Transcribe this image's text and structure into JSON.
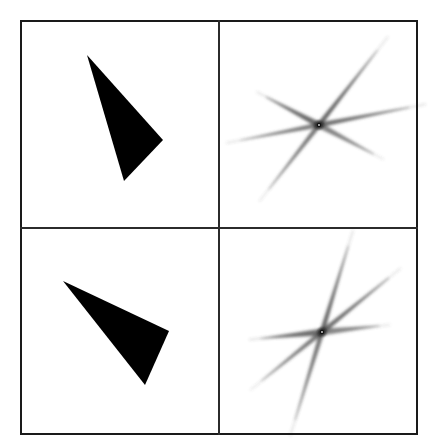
{
  "figure": {
    "type": "image-grid",
    "background_color": "#ffffff",
    "canvas": {
      "width": 437,
      "height": 448
    },
    "frame": {
      "x": 20,
      "y": 20,
      "width": 398,
      "height": 415,
      "border_color": "#1a1a1a",
      "border_width": 2,
      "divider_color": "#2b2b2b",
      "divider_width": 2,
      "divider_x": 219,
      "divider_y": 228
    },
    "panels": [
      {
        "name": "top-left-triangle",
        "row": 0,
        "col": 0,
        "content": "triangle",
        "fill_color": "#000000",
        "vertices": [
          [
            87,
            55
          ],
          [
            163,
            140
          ],
          [
            124,
            181
          ]
        ]
      },
      {
        "name": "top-right-spectrum",
        "row": 0,
        "col": 1,
        "content": "spectrum-star",
        "center": [
          319,
          125
        ],
        "core_color": "#111111",
        "ray_color": "#4a4a4a",
        "rays": [
          {
            "angle_deg": -52,
            "length": 95,
            "width": 5,
            "opacity": 0.82
          },
          {
            "angle_deg": 128,
            "length": 82,
            "width": 5,
            "opacity": 0.72
          },
          {
            "angle_deg": -11,
            "length": 92,
            "width": 5,
            "opacity": 0.78
          },
          {
            "angle_deg": 169,
            "length": 80,
            "width": 5,
            "opacity": 0.7
          },
          {
            "angle_deg": -152,
            "length": 60,
            "width": 6,
            "opacity": 0.8
          },
          {
            "angle_deg": 28,
            "length": 62,
            "width": 6,
            "opacity": 0.66
          }
        ]
      },
      {
        "name": "bottom-left-triangle",
        "row": 1,
        "col": 0,
        "content": "triangle",
        "fill_color": "#000000",
        "vertices": [
          [
            63,
            281
          ],
          [
            169,
            331
          ],
          [
            145,
            385
          ]
        ]
      },
      {
        "name": "bottom-right-spectrum",
        "row": 1,
        "col": 1,
        "content": "spectrum-star",
        "center": [
          322,
          332
        ],
        "core_color": "#111111",
        "ray_color": "#4a4a4a",
        "rays": [
          {
            "angle_deg": -73,
            "length": 90,
            "width": 5,
            "opacity": 0.8
          },
          {
            "angle_deg": 107,
            "length": 92,
            "width": 5,
            "opacity": 0.74
          },
          {
            "angle_deg": -39,
            "length": 86,
            "width": 5,
            "opacity": 0.78
          },
          {
            "angle_deg": 141,
            "length": 78,
            "width": 5,
            "opacity": 0.72
          },
          {
            "angle_deg": 174,
            "length": 62,
            "width": 7,
            "opacity": 0.78
          },
          {
            "angle_deg": -6,
            "length": 58,
            "width": 7,
            "opacity": 0.64
          }
        ]
      }
    ]
  }
}
